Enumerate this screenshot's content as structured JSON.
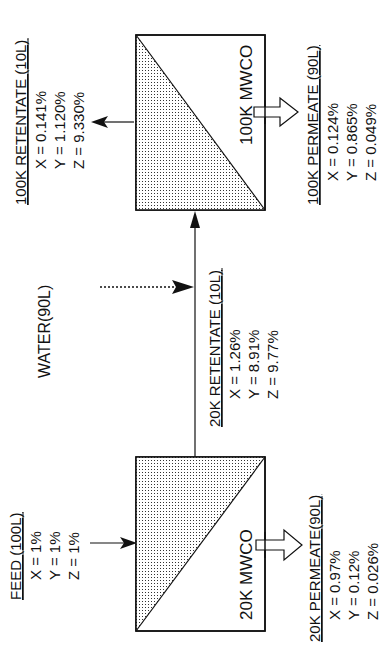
{
  "diagram": {
    "orientation": "rotated-90-ccw",
    "units": {
      "box_100k": {
        "label": "100K MWCO"
      },
      "box_20k": {
        "label": "20K MWCO"
      }
    },
    "streams": {
      "feed": {
        "title": "FEED (100L)",
        "x": "X = 1%",
        "y": "Y = 1%",
        "z": "Z = 1%"
      },
      "water": {
        "title": "WATER(90L)"
      },
      "retentate_20k": {
        "title": "20K RETENTATE (10L)",
        "x": "X = 1.26%",
        "y": "Y = 8.91%",
        "z": "Z = 9.77%"
      },
      "permeate_20k": {
        "title": "20K PERMEATE(90L)",
        "x": "X = 0.97%",
        "y": "Y = 0.12%",
        "z": "Z = 0.026%"
      },
      "retentate_100k": {
        "title": "100K RETENTATE (10L)",
        "x": "X = 0.141%",
        "y": "Y = 1.120%",
        "z": "Z = 9.330%"
      },
      "permeate_100k": {
        "title": "100K PERMEATE (90L)",
        "x": "X = 0.124%",
        "y": "Y = 0.865%",
        "z": "Z = 0.049%"
      }
    }
  }
}
